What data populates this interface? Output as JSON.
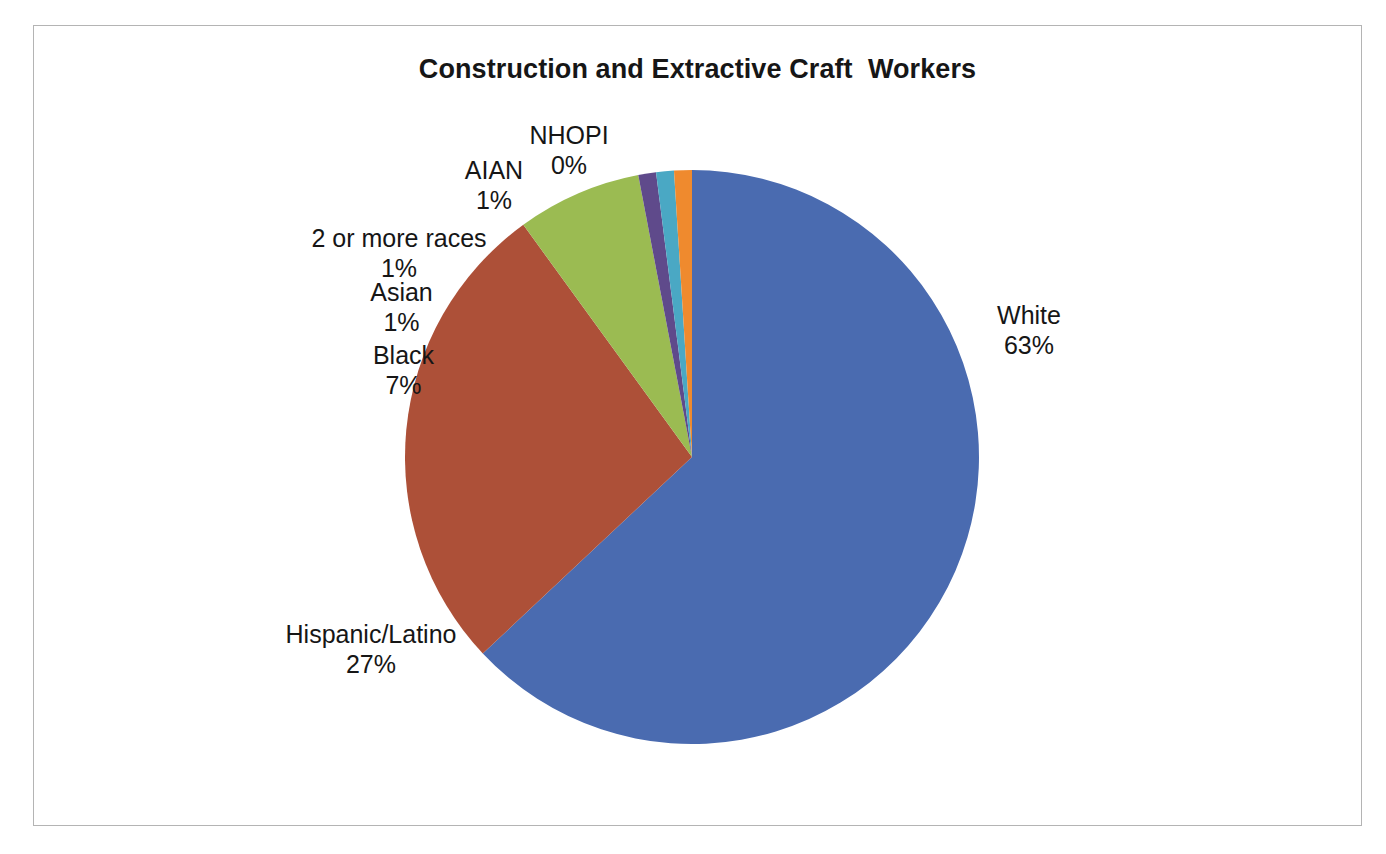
{
  "chart_data": {
    "type": "pie",
    "title": "Construction and Extractive Craft  Workers",
    "xlabel": "",
    "ylabel": "",
    "legend_position": "none",
    "grid": false,
    "labels_show_category": true,
    "labels_show_percent": true,
    "start_angle_deg": 0,
    "direction": "clockwise",
    "categories": [
      "White",
      "Hispanic/Latino",
      "Black",
      "Asian",
      "2 or more races",
      "AIAN",
      "NHOPI"
    ],
    "values": [
      63,
      27,
      7,
      1,
      1,
      1,
      0
    ],
    "percent_labels": [
      "63%",
      "27%",
      "7%",
      "1%",
      "1%",
      "1%",
      "0%"
    ],
    "colors": [
      "#4a6bb0",
      "#ad5038",
      "#9bbb52",
      "#5f4a8b",
      "#4aa8c4",
      "#ef8a2e",
      "#4a6bb0"
    ],
    "slices": [
      {
        "name": "White",
        "value": 63,
        "percent": "63%",
        "color": "#4a6bb0",
        "start_deg": 0.0,
        "sweep_deg": 226.8
      },
      {
        "name": "Hispanic/Latino",
        "value": 27,
        "percent": "27%",
        "color": "#ad5038",
        "start_deg": 226.8,
        "sweep_deg": 97.2
      },
      {
        "name": "Black",
        "value": 7,
        "percent": "7%",
        "color": "#9bbb52",
        "start_deg": 324.0,
        "sweep_deg": 25.2
      },
      {
        "name": "Asian",
        "value": 1,
        "percent": "1%",
        "color": "#5f4a8b",
        "start_deg": 349.2,
        "sweep_deg": 3.6
      },
      {
        "name": "2 or more races",
        "value": 1,
        "percent": "1%",
        "color": "#4aa8c4",
        "start_deg": 352.8,
        "sweep_deg": 3.6
      },
      {
        "name": "AIAN",
        "value": 1,
        "percent": "1%",
        "color": "#ef8a2e",
        "start_deg": 356.4,
        "sweep_deg": 3.6
      },
      {
        "name": "NHOPI",
        "value": 0,
        "percent": "0%",
        "color": "#4a6bb0",
        "start_deg": 360.0,
        "sweep_deg": 0.0
      }
    ]
  },
  "labels": {
    "nhopi": {
      "name": "NHOPI",
      "value": "0%"
    },
    "aian": {
      "name": "AIAN",
      "value": "1%"
    },
    "two": {
      "name": "2 or more races",
      "value": "1%"
    },
    "asian": {
      "name": "Asian",
      "value": "1%"
    },
    "black": {
      "name": "Black",
      "value": "7%"
    },
    "hisp": {
      "name": "Hispanic/Latino",
      "value": "27%"
    },
    "white": {
      "name": "White",
      "value": "63%"
    }
  }
}
